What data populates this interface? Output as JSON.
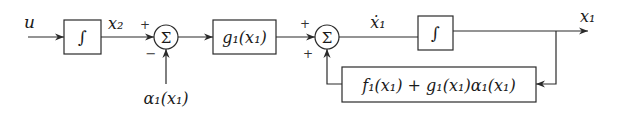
{
  "diagram": {
    "type": "block-diagram",
    "signals": {
      "input": "u",
      "x2": "x₂",
      "alpha": "α₁(x₁)",
      "x1dot": "ẋ₁",
      "output": "x₁"
    },
    "blocks": {
      "integrator1": "∫",
      "g_block": "g₁(x₁)",
      "integrator2": "∫",
      "feedback_block": "f₁(x₁) + g₁(x₁)α₁(x₁)"
    },
    "summers": {
      "sum1": {
        "symbol": "Σ",
        "top_sign": "+",
        "bottom_sign": "−"
      },
      "sum2": {
        "symbol": "Σ",
        "top_sign": "+",
        "bottom_sign": "+"
      }
    },
    "colors": {
      "line": "#2a2a2a",
      "text": "#1a1a1a",
      "background": "#ffffff"
    }
  }
}
